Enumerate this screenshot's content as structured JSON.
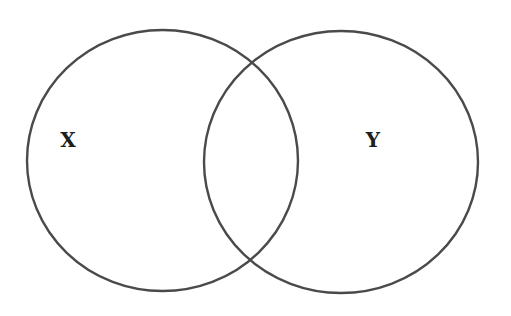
{
  "diagram": {
    "type": "venn",
    "sets": [
      {
        "id": "X",
        "label": "X",
        "cx": 162.5,
        "cy": 160.5,
        "rx": 135.5,
        "ry": 130.5,
        "label_x": 68,
        "label_y": 147
      },
      {
        "id": "Y",
        "label": "Y",
        "cx": 341,
        "cy": 162,
        "rx": 137,
        "ry": 131,
        "label_x": 373,
        "label_y": 147
      }
    ],
    "stroke_color": "#4a4a4a",
    "background": "#ffffff"
  }
}
